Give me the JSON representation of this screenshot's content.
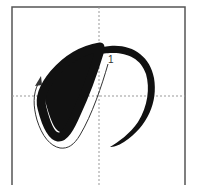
{
  "diagram": {
    "character": "の",
    "stroke_count": 1,
    "strokes": [
      {
        "number": "1"
      }
    ],
    "colors": {
      "frame": "#555555",
      "guide": "#999999",
      "stroke": "#111111",
      "arrow": "#333333"
    }
  }
}
